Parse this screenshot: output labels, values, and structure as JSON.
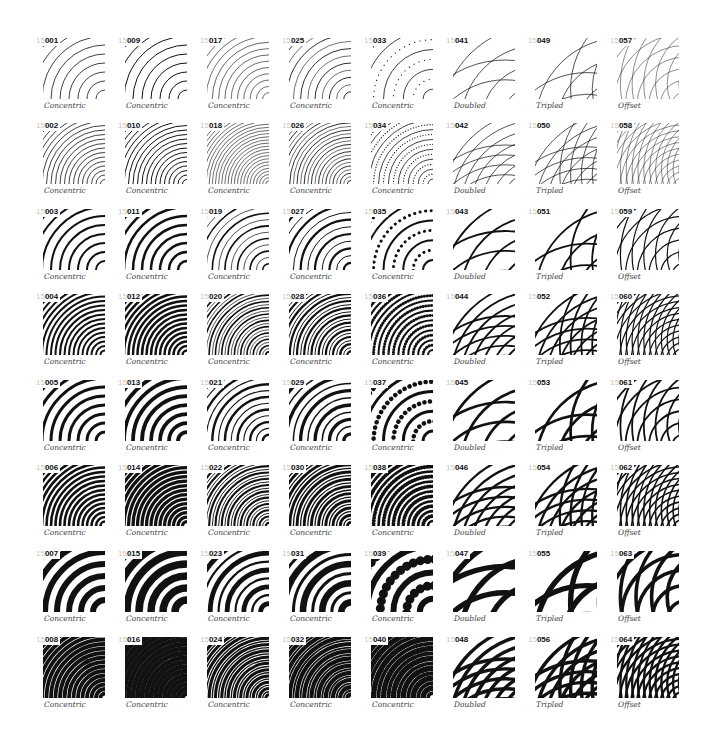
{
  "sheet": {
    "prefix": "15",
    "columns": [
      {
        "type": "Concentric",
        "start": 1
      },
      {
        "type": "Concentric",
        "start": 9
      },
      {
        "type": "Concentric",
        "start": 17
      },
      {
        "type": "Concentric",
        "start": 25
      },
      {
        "type": "Concentric",
        "start": 33
      },
      {
        "type": "Doubled",
        "start": 41
      },
      {
        "type": "Tripled",
        "start": 49
      },
      {
        "type": "Offset",
        "start": 57
      }
    ],
    "rows": 8,
    "col_x": [
      36,
      118,
      200,
      282,
      364,
      446,
      528,
      610
    ],
    "row_y": [
      38,
      123,
      209,
      294,
      380,
      465,
      551,
      637
    ]
  },
  "tiles": [
    {
      "id": "001",
      "label": "Concentric"
    },
    {
      "id": "002",
      "label": "Concentric"
    },
    {
      "id": "003",
      "label": "Concentric"
    },
    {
      "id": "004",
      "label": "Concentric"
    },
    {
      "id": "005",
      "label": "Concentric"
    },
    {
      "id": "006",
      "label": "Concentric"
    },
    {
      "id": "007",
      "label": "Concentric"
    },
    {
      "id": "008",
      "label": "Concentric"
    },
    {
      "id": "009",
      "label": "Concentric"
    },
    {
      "id": "010",
      "label": "Concentric"
    },
    {
      "id": "011",
      "label": "Concentric"
    },
    {
      "id": "012",
      "label": "Concentric"
    },
    {
      "id": "013",
      "label": "Concentric"
    },
    {
      "id": "014",
      "label": "Concentric"
    },
    {
      "id": "015",
      "label": "Concentric"
    },
    {
      "id": "016",
      "label": "Concentric"
    },
    {
      "id": "017",
      "label": "Concentric"
    },
    {
      "id": "018",
      "label": "Concentric"
    },
    {
      "id": "019",
      "label": "Concentric"
    },
    {
      "id": "020",
      "label": "Concentric"
    },
    {
      "id": "021",
      "label": "Concentric"
    },
    {
      "id": "022",
      "label": "Concentric"
    },
    {
      "id": "023",
      "label": "Concentric"
    },
    {
      "id": "024",
      "label": "Concentric"
    },
    {
      "id": "025",
      "label": "Concentric"
    },
    {
      "id": "026",
      "label": "Concentric"
    },
    {
      "id": "027",
      "label": "Concentric"
    },
    {
      "id": "028",
      "label": "Concentric"
    },
    {
      "id": "029",
      "label": "Concentric"
    },
    {
      "id": "030",
      "label": "Concentric"
    },
    {
      "id": "031",
      "label": "Concentric"
    },
    {
      "id": "032",
      "label": "Concentric"
    },
    {
      "id": "033",
      "label": "Concentric"
    },
    {
      "id": "034",
      "label": "Concentric"
    },
    {
      "id": "035",
      "label": "Concentric"
    },
    {
      "id": "036",
      "label": "Concentric"
    },
    {
      "id": "037",
      "label": "Concentric"
    },
    {
      "id": "038",
      "label": "Concentric"
    },
    {
      "id": "039",
      "label": "Concentric"
    },
    {
      "id": "040",
      "label": "Concentric"
    },
    {
      "id": "041",
      "label": "Doubled"
    },
    {
      "id": "042",
      "label": "Doubled"
    },
    {
      "id": "043",
      "label": "Doubled"
    },
    {
      "id": "044",
      "label": "Doubled"
    },
    {
      "id": "045",
      "label": "Doubled"
    },
    {
      "id": "046",
      "label": "Doubled"
    },
    {
      "id": "047",
      "label": "Doubled"
    },
    {
      "id": "048",
      "label": "Doubled"
    },
    {
      "id": "049",
      "label": "Tripled"
    },
    {
      "id": "050",
      "label": "Tripled"
    },
    {
      "id": "051",
      "label": "Tripled"
    },
    {
      "id": "052",
      "label": "Tripled"
    },
    {
      "id": "053",
      "label": "Tripled"
    },
    {
      "id": "054",
      "label": "Tripled"
    },
    {
      "id": "055",
      "label": "Tripled"
    },
    {
      "id": "056",
      "label": "Tripled"
    },
    {
      "id": "057",
      "label": "Offset"
    },
    {
      "id": "058",
      "label": "Offset"
    },
    {
      "id": "059",
      "label": "Offset"
    },
    {
      "id": "060",
      "label": "Offset"
    },
    {
      "id": "061",
      "label": "Offset"
    },
    {
      "id": "062",
      "label": "Offset"
    },
    {
      "id": "063",
      "label": "Offset"
    },
    {
      "id": "064",
      "label": "Offset"
    }
  ],
  "row_styles": [
    {
      "spacing": 9,
      "width": 0.8
    },
    {
      "spacing": 4.5,
      "width": 0.8
    },
    {
      "spacing": 9,
      "width": 2.0
    },
    {
      "spacing": 4.5,
      "width": 2.0
    },
    {
      "spacing": 9,
      "width": 3.0
    },
    {
      "spacing": 4.5,
      "width": 2.6
    },
    {
      "spacing": 12,
      "width": 6.0
    },
    {
      "spacing": 4.5,
      "width": 3.8
    }
  ],
  "colors": {
    "ink": "#111111",
    "paper": "#ffffff",
    "prefix": "#c8c8c8",
    "caption": "#444444"
  }
}
